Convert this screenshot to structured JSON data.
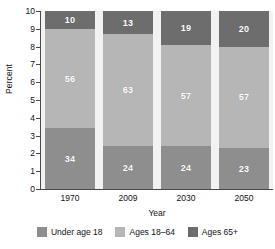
{
  "chart_data": {
    "type": "bar",
    "title": "",
    "subtitle": "",
    "xlabel": "Year",
    "ylabel": "Percent",
    "ylim": [
      0,
      10
    ],
    "yticks": [
      "0",
      "1",
      "2",
      "3",
      "4",
      "5",
      "6",
      "7",
      "8",
      "9",
      "10"
    ],
    "grid": false,
    "stacked": true,
    "stack_mode": "percent",
    "legend_position": "bottom",
    "categories": [
      "1970",
      "2009",
      "2030",
      "2050"
    ],
    "series": [
      {
        "name": "Under age 18",
        "color": "#8e8e8e",
        "values": [
          34,
          24,
          24,
          23
        ],
        "labels": [
          "34",
          "24",
          "24",
          "23"
        ]
      },
      {
        "name": "Ages 18–64",
        "color": "#b6b6b6",
        "values": [
          56,
          63,
          57,
          57
        ],
        "labels": [
          "56",
          "63",
          "57",
          "57"
        ]
      },
      {
        "name": "Ages 65+",
        "color": "#6d6d6d",
        "values": [
          10,
          13,
          19,
          20
        ],
        "labels": [
          "10",
          "13",
          "19",
          "20"
        ]
      }
    ]
  },
  "axes": {
    "y_title": "Percent",
    "x_title": "Year",
    "y_tick_labels": [
      "10",
      "9",
      "8",
      "7",
      "6",
      "5",
      "4",
      "3",
      "2",
      "1",
      "0"
    ],
    "x_tick_labels": [
      "1970",
      "2009",
      "2030",
      "2050"
    ]
  },
  "legend": {
    "items": [
      {
        "label": "Under age 18",
        "color": "#8e8e8e"
      },
      {
        "label": "Ages 18–64",
        "color": "#b6b6b6"
      },
      {
        "label": "Ages 65+",
        "color": "#6d6d6d"
      }
    ]
  },
  "colors": {
    "plot_background": "#f2f2f0",
    "axis": "#4a4a4a",
    "text": "#111111",
    "bar_label_text": "#ffffff"
  },
  "bars": [
    {
      "category": "1970",
      "segments": [
        {
          "series": "Ages 65+",
          "label": "10",
          "value": 10
        },
        {
          "series": "Ages 18–64",
          "label": "56",
          "value": 56
        },
        {
          "series": "Under age 18",
          "label": "34",
          "value": 34
        }
      ]
    },
    {
      "category": "2009",
      "segments": [
        {
          "series": "Ages 65+",
          "label": "13",
          "value": 13
        },
        {
          "series": "Ages 18–64",
          "label": "63",
          "value": 63
        },
        {
          "series": "Under age 18",
          "label": "24",
          "value": 24
        }
      ]
    },
    {
      "category": "2030",
      "segments": [
        {
          "series": "Ages 65+",
          "label": "19",
          "value": 19
        },
        {
          "series": "Ages 18–64",
          "label": "57",
          "value": 57
        },
        {
          "series": "Under age 18",
          "label": "24",
          "value": 24
        }
      ]
    },
    {
      "category": "2050",
      "segments": [
        {
          "series": "Ages 65+",
          "label": "20",
          "value": 20
        },
        {
          "series": "Ages 18–64",
          "label": "57",
          "value": 57
        },
        {
          "series": "Under age 18",
          "label": "23",
          "value": 23
        }
      ]
    }
  ]
}
